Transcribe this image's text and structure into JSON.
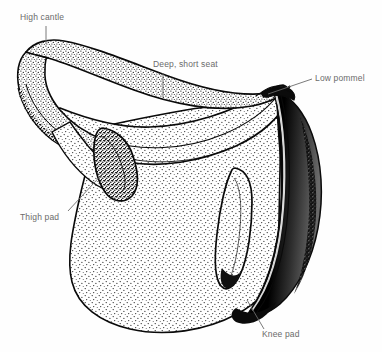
{
  "figure": {
    "kind": "line-art technical illustration",
    "background_color": "#fefefe",
    "ink_color": "#000000",
    "label_color": "#6b6b6b",
    "width": 382,
    "height": 352
  },
  "labels": {
    "high_cantle": "High cantle",
    "deep_short_seat": "Deep, short seat",
    "low_pommel": "Low pommel",
    "thigh_pad": "Thigh pad",
    "knee_pad": "Knee pad"
  },
  "parts": [
    {
      "id": "cantle",
      "name": "high-cantle",
      "description": "raised rolled rear rim of the saddle, upper left"
    },
    {
      "id": "seat",
      "name": "deep-short-seat",
      "description": "dipped stippled seat between cantle and pommel"
    },
    {
      "id": "pommel",
      "name": "low-pommel",
      "description": "low front arch at upper right"
    },
    {
      "id": "thighpad",
      "name": "thigh-pad",
      "description": "elongated vertical roll on the left flap"
    },
    {
      "id": "kneeroll",
      "name": "inner-knee-roll",
      "description": "elongated vertical roll on the right flap"
    },
    {
      "id": "kneepad",
      "name": "knee-pad",
      "description": "dark heavily shaded pad along the right edge"
    },
    {
      "id": "flap",
      "name": "saddle-flap",
      "description": "large rounded stippled body of the saddle flap"
    }
  ]
}
